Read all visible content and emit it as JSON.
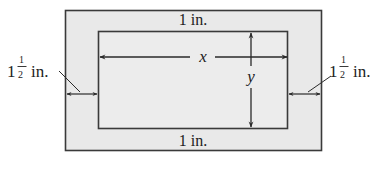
{
  "diagram": {
    "colors": {
      "fill": "#e9e9e9",
      "stroke": "#3a3a3a",
      "text": "#222222"
    },
    "labels": {
      "top_margin": "1 in.",
      "bottom_margin": "1 in.",
      "left_margin_whole": "1",
      "left_margin_num": "1",
      "left_margin_den": "2",
      "left_margin_unit": "in.",
      "right_margin_whole": "1",
      "right_margin_num": "1",
      "right_margin_den": "2",
      "right_margin_unit": "in.",
      "width_var": "x",
      "height_var": "y"
    }
  }
}
